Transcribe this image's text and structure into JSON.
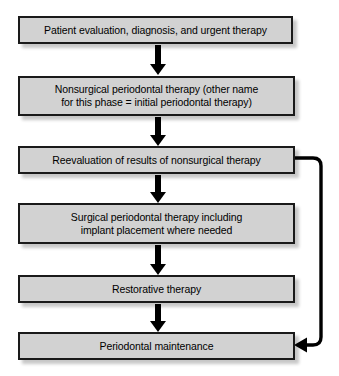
{
  "diagram": {
    "type": "flowchart",
    "orientation": "vertical",
    "background_color": "#ffffff",
    "node_fill_color": "#d2d2d2",
    "node_border_color": "#1a1a1a",
    "connector_color": "#000000",
    "nodes": [
      {
        "id": "step-1",
        "label": "Patient evaluation, diagnosis, and urgent therapy"
      },
      {
        "id": "step-2",
        "label": "Nonsurgical periodontal therapy (other name\nfor this phase = initial periodontal therapy)"
      },
      {
        "id": "step-3",
        "label": "Reevaluation of results of nonsurgical therapy"
      },
      {
        "id": "step-4",
        "label": "Surgical periodontal therapy including\nimplant placement where needed"
      },
      {
        "id": "step-5",
        "label": "Restorative therapy"
      },
      {
        "id": "step-6",
        "label": "Periodontal maintenance"
      }
    ],
    "connectors": [
      {
        "from": "step-1",
        "to": "step-2",
        "style": "solid-arrow-down"
      },
      {
        "from": "step-2",
        "to": "step-3",
        "style": "solid-arrow-down"
      },
      {
        "from": "step-3",
        "to": "step-4",
        "style": "solid-arrow-down"
      },
      {
        "from": "step-4",
        "to": "step-5",
        "style": "solid-arrow-down"
      },
      {
        "from": "step-5",
        "to": "step-6",
        "style": "solid-arrow-down"
      },
      {
        "from": "step-3",
        "to": "step-6",
        "style": "right-side-feedback-loop-arrow-left"
      }
    ]
  }
}
